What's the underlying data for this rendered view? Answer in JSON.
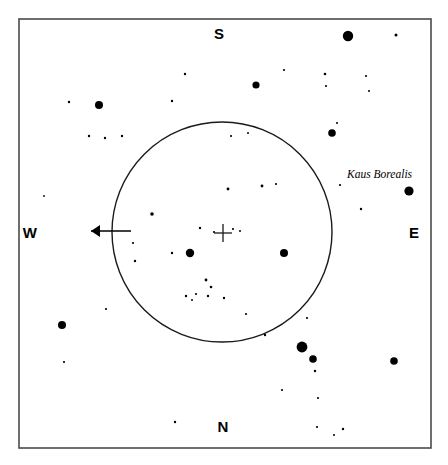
{
  "chart_data": {
    "type": "scatter",
    "title": "",
    "subtitle": "",
    "xlabel": "",
    "ylabel": "",
    "grid": false,
    "legend_position": "none",
    "projection": "star-chart",
    "frame": {
      "x": 19,
      "y": 19,
      "width": 412,
      "height": 429,
      "stroke": "#4a4a4a",
      "stroke_width": 1.6
    },
    "cardinal_labels": [
      {
        "name": "south",
        "text": "S",
        "x": 219,
        "y": 33
      },
      {
        "name": "north",
        "text": "N",
        "x": 223,
        "y": 426
      },
      {
        "name": "west",
        "text": "W",
        "x": 30,
        "y": 232
      },
      {
        "name": "east",
        "text": "E",
        "x": 414,
        "y": 232
      }
    ],
    "field_circle": {
      "cx": 222,
      "cy": 232,
      "r": 110,
      "stroke": "#1a1a1a",
      "stroke_width": 1.4,
      "fill": "none"
    },
    "crosshair": {
      "cx": 223,
      "cy": 233,
      "arm": 9,
      "stroke": "#1a1a1a",
      "stroke_width": 1.3
    },
    "direction_arrow": {
      "label": "west-arrow",
      "x1": 131,
      "y1": 231,
      "x2": 91,
      "y2": 231,
      "head_length": 9,
      "head_width": 6,
      "stroke": "#000000",
      "stroke_width": 1.6
    },
    "annotations": [
      {
        "text": "Kaus Borealis",
        "x": 347,
        "y": 178,
        "style": "italic-serif",
        "target_star": 23
      }
    ],
    "star_color": "#000000",
    "magnitude_scale": {
      "note": "radius in px approximates visual magnitude; larger = brighter"
    },
    "stars": [
      {
        "id": 0,
        "x": 348,
        "y": 36,
        "r": 5.2
      },
      {
        "id": 1,
        "x": 396,
        "y": 35,
        "r": 1.5
      },
      {
        "id": 2,
        "x": 256,
        "y": 85,
        "r": 3.6
      },
      {
        "id": 3,
        "x": 185,
        "y": 74,
        "r": 1.2
      },
      {
        "id": 4,
        "x": 284,
        "y": 70,
        "r": 1.1
      },
      {
        "id": 5,
        "x": 325,
        "y": 74,
        "r": 1.3
      },
      {
        "id": 6,
        "x": 366,
        "y": 76,
        "r": 1.1
      },
      {
        "id": 7,
        "x": 326,
        "y": 86,
        "r": 1.1
      },
      {
        "id": 8,
        "x": 369,
        "y": 91,
        "r": 1.0
      },
      {
        "id": 9,
        "x": 99,
        "y": 105,
        "r": 4.0
      },
      {
        "id": 10,
        "x": 69,
        "y": 102,
        "r": 1.2
      },
      {
        "id": 11,
        "x": 172,
        "y": 101,
        "r": 1.2
      },
      {
        "id": 12,
        "x": 332,
        "y": 133,
        "r": 3.8
      },
      {
        "id": 13,
        "x": 89,
        "y": 136,
        "r": 1.2
      },
      {
        "id": 14,
        "x": 105,
        "y": 138,
        "r": 1.2
      },
      {
        "id": 15,
        "x": 122,
        "y": 136,
        "r": 1.2
      },
      {
        "id": 16,
        "x": 231,
        "y": 136,
        "r": 1.1
      },
      {
        "id": 17,
        "x": 248,
        "y": 133,
        "r": 1.0
      },
      {
        "id": 18,
        "x": 337,
        "y": 123,
        "r": 1.0
      },
      {
        "id": 19,
        "x": 228,
        "y": 189,
        "r": 1.4
      },
      {
        "id": 20,
        "x": 262,
        "y": 186,
        "r": 1.4
      },
      {
        "id": 21,
        "x": 276,
        "y": 184,
        "r": 1.1
      },
      {
        "id": 22,
        "x": 340,
        "y": 185,
        "r": 1.1
      },
      {
        "id": 23,
        "x": 409,
        "y": 191,
        "r": 4.6
      },
      {
        "id": 24,
        "x": 152,
        "y": 214,
        "r": 1.8
      },
      {
        "id": 25,
        "x": 361,
        "y": 209,
        "r": 1.2
      },
      {
        "id": 26,
        "x": 200,
        "y": 228,
        "r": 1.2
      },
      {
        "id": 27,
        "x": 214,
        "y": 232,
        "r": 1.1
      },
      {
        "id": 28,
        "x": 233,
        "y": 229,
        "r": 1.1
      },
      {
        "id": 29,
        "x": 240,
        "y": 231,
        "r": 1.0
      },
      {
        "id": 30,
        "x": 190,
        "y": 253,
        "r": 4.2
      },
      {
        "id": 31,
        "x": 284,
        "y": 253,
        "r": 4.0
      },
      {
        "id": 32,
        "x": 133,
        "y": 243,
        "r": 1.1
      },
      {
        "id": 33,
        "x": 172,
        "y": 253,
        "r": 1.2
      },
      {
        "id": 34,
        "x": 135,
        "y": 261,
        "r": 1.2
      },
      {
        "id": 35,
        "x": 206,
        "y": 280,
        "r": 1.4
      },
      {
        "id": 36,
        "x": 211,
        "y": 287,
        "r": 1.3
      },
      {
        "id": 37,
        "x": 208,
        "y": 296,
        "r": 1.2
      },
      {
        "id": 38,
        "x": 196,
        "y": 294,
        "r": 1.1
      },
      {
        "id": 39,
        "x": 186,
        "y": 296,
        "r": 1.2
      },
      {
        "id": 40,
        "x": 192,
        "y": 300,
        "r": 1.0
      },
      {
        "id": 41,
        "x": 224,
        "y": 298,
        "r": 1.2
      },
      {
        "id": 42,
        "x": 62,
        "y": 325,
        "r": 4.0
      },
      {
        "id": 43,
        "x": 64,
        "y": 362,
        "r": 1.1
      },
      {
        "id": 44,
        "x": 246,
        "y": 314,
        "r": 1.1
      },
      {
        "id": 45,
        "x": 307,
        "y": 318,
        "r": 1.1
      },
      {
        "id": 46,
        "x": 265,
        "y": 335,
        "r": 1.2
      },
      {
        "id": 47,
        "x": 302,
        "y": 347,
        "r": 5.4
      },
      {
        "id": 48,
        "x": 313,
        "y": 359,
        "r": 3.8
      },
      {
        "id": 49,
        "x": 394,
        "y": 361,
        "r": 3.8
      },
      {
        "id": 50,
        "x": 315,
        "y": 371,
        "r": 1.2
      },
      {
        "id": 51,
        "x": 282,
        "y": 390,
        "r": 1.1
      },
      {
        "id": 52,
        "x": 318,
        "y": 398,
        "r": 1.1
      },
      {
        "id": 53,
        "x": 175,
        "y": 422,
        "r": 1.2
      },
      {
        "id": 54,
        "x": 317,
        "y": 427,
        "r": 1.1
      },
      {
        "id": 55,
        "x": 343,
        "y": 429,
        "r": 1.2
      },
      {
        "id": 56,
        "x": 334,
        "y": 435,
        "r": 1.0
      },
      {
        "id": 57,
        "x": 106,
        "y": 309,
        "r": 1.1
      },
      {
        "id": 58,
        "x": 44,
        "y": 196,
        "r": 0.9
      }
    ]
  },
  "labels": {
    "kaus_borealis": "Kaus Borealis",
    "south": "S",
    "north": "N",
    "west": "W",
    "east": "E"
  }
}
